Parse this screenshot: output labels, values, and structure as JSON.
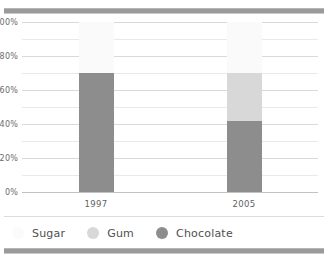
{
  "chart_data": {
    "type": "bar",
    "stacked": true,
    "categories": [
      "1997",
      "2005"
    ],
    "series": [
      {
        "name": "Chocolate",
        "values": [
          70,
          42
        ],
        "color": "#8d8d8d"
      },
      {
        "name": "Gum",
        "values": [
          0,
          28
        ],
        "color": "#d8d8d8"
      },
      {
        "name": "Sugar",
        "values": [
          30,
          30
        ],
        "color": "#fafafa"
      }
    ],
    "title": "",
    "xlabel": "",
    "ylabel": "",
    "ylim": [
      0,
      100
    ],
    "ytick_labels": [
      "100%",
      "80%",
      "60%",
      "40%",
      "20%",
      "0%"
    ],
    "ytick_values": [
      100,
      80,
      60,
      40,
      20,
      0
    ],
    "gridline_values": [
      100,
      90,
      80,
      70,
      60,
      50,
      40,
      30,
      20,
      10,
      0
    ],
    "grid": true,
    "legend_position": "bottom",
    "legend_order": [
      "Sugar",
      "Gum",
      "Chocolate"
    ]
  },
  "legend": {
    "items": [
      {
        "label": "Sugar",
        "color": "#fbfbfb",
        "marker": "circle"
      },
      {
        "label": "Gum",
        "color": "#d8d8d8",
        "marker": "circle"
      },
      {
        "label": "Chocolate",
        "color": "#8d8d8d",
        "marker": "circle"
      }
    ]
  },
  "decor": {
    "rule_color": "#9a9a9a"
  }
}
